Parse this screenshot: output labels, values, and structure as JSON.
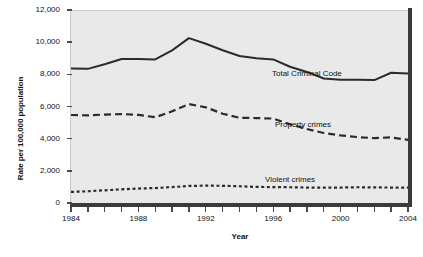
{
  "chart_data": {
    "type": "line",
    "title": "",
    "xlabel": "Year",
    "ylabel": "Rate per 100,000 population",
    "xlim": [
      1984,
      2004
    ],
    "ylim": [
      0,
      12000
    ],
    "grid": false,
    "legend_position": "inline-annotations",
    "x": [
      1984,
      1985,
      1986,
      1987,
      1988,
      1989,
      1990,
      1991,
      1992,
      1993,
      1994,
      1995,
      1996,
      1997,
      1998,
      1999,
      2000,
      2001,
      2002,
      2003,
      2004
    ],
    "x_tick_labels": [
      "1984",
      "1988",
      "1992",
      "1996",
      "2000",
      "2004"
    ],
    "x_tick_values": [
      1984,
      1988,
      1992,
      1996,
      2000,
      2004
    ],
    "y_tick_labels": [
      "0",
      "2,000",
      "4,000",
      "6,000",
      "8,000",
      "10,000",
      "12,000"
    ],
    "y_tick_values": [
      0,
      2000,
      4000,
      6000,
      8000,
      10000,
      12000
    ],
    "series": [
      {
        "name": "Total Criminal Code",
        "style": "solid",
        "color": "#2b2b2b",
        "annotation": "Total Criminal Code",
        "values": [
          8370,
          8340,
          8630,
          8950,
          8960,
          8930,
          9490,
          10250,
          9900,
          9500,
          9140,
          9000,
          8930,
          8470,
          8150,
          7740,
          7660,
          7660,
          7640,
          8100,
          8050
        ]
      },
      {
        "name": "Property crimes",
        "style": "dashed",
        "color": "#2b2b2b",
        "annotation": "Property crimes",
        "values": [
          5470,
          5450,
          5500,
          5530,
          5480,
          5330,
          5700,
          6150,
          5950,
          5550,
          5300,
          5280,
          5250,
          4900,
          4600,
          4350,
          4200,
          4100,
          4030,
          4080,
          3920
        ]
      },
      {
        "name": "Violent crimes",
        "style": "dotted",
        "color": "#2b2b2b",
        "annotation": "Violent crimes",
        "values": [
          690,
          730,
          790,
          850,
          900,
          930,
          990,
          1060,
          1080,
          1070,
          1040,
          1000,
          990,
          980,
          960,
          950,
          960,
          980,
          970,
          960,
          950
        ]
      }
    ],
    "annotations": [
      {
        "text": "Total Criminal Code",
        "x_px": 272,
        "y_px": 69
      },
      {
        "text": "Property crimes",
        "x_px": 275,
        "y_px": 120
      },
      {
        "text": "Violent crimes",
        "x_px": 265,
        "y_px": 175
      }
    ],
    "colors": {
      "plot_background": "#e9e9e9",
      "axis": "#3a3a3a",
      "text": "#111111",
      "line": "#2b2b2b"
    }
  }
}
